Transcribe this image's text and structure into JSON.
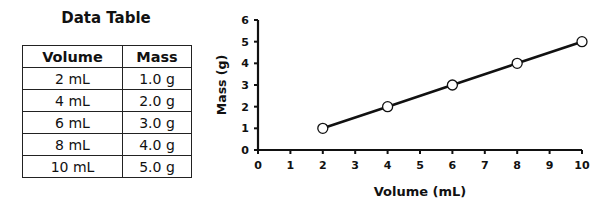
{
  "table": {
    "title": "Data Table",
    "headers": [
      "Volume",
      "Mass"
    ],
    "rows": [
      [
        "2 mL",
        "1.0 g"
      ],
      [
        "4 mL",
        "2.0 g"
      ],
      [
        "6 mL",
        "3.0 g"
      ],
      [
        "8 mL",
        "4.0 g"
      ],
      [
        "10 mL",
        "5.0 g"
      ]
    ]
  },
  "chart_data": {
    "type": "line",
    "title": "",
    "xlabel": "Volume (mL)",
    "ylabel": "Mass (g)",
    "x": [
      2,
      4,
      6,
      8,
      10
    ],
    "series": [
      {
        "name": "Mass",
        "values": [
          1,
          2,
          3,
          4,
          5
        ]
      }
    ],
    "xlim": [
      0,
      10
    ],
    "ylim": [
      0,
      6
    ],
    "xticks": [
      "0",
      "1",
      "2",
      "3",
      "4",
      "5",
      "6",
      "7",
      "8",
      "9",
      "10"
    ],
    "yticks": [
      "0",
      "1",
      "2",
      "3",
      "4",
      "5",
      "6"
    ],
    "grid": false,
    "marker": "open-circle",
    "line_color": "#111111"
  }
}
